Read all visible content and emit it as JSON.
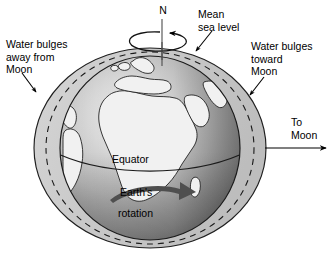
{
  "figure": {
    "kind": "earth-tidal-bulge-diagram",
    "background_color": "#ffffff",
    "ink_color": "#000000"
  },
  "labels": {
    "north_pole": "N",
    "mean_sea_level": "Mean\nsea level",
    "bulge_away": "Water bulges\naway from\nMoon",
    "bulge_toward": "Water bulges\ntoward\nMoon",
    "to_moon": "To\nMoon",
    "equator": "Equator",
    "earth_rotation_line1": "Earth's",
    "earth_rotation_line2": "rotation"
  },
  "colors": {
    "bulge_fill": "#c9c9c9",
    "sphere_light": "#f2f2f2",
    "sphere_mid": "#b5b5b5",
    "sphere_dark": "#8a8a8a",
    "sphere_darkest": "#6e6e6e",
    "land_fill": "#f0f0f0",
    "outline": "#1a1a1a",
    "dashed": "#1a1a1a",
    "rotation_arrow": "#4a4a4a"
  },
  "geometry": {
    "sphere_center_x": 150,
    "sphere_center_y": 148,
    "sphere_radius_x": 90,
    "sphere_radius_y": 92,
    "bulge_radius_x": 116,
    "bulge_radius_y": 100,
    "mean_sea_level_radius_x": 104,
    "mean_sea_level_radius_y": 96
  },
  "elements": {
    "polar_axis": "vertical rotation axis through north pole",
    "rotation_ellipse": "counterclockwise arrow circling the polar axis",
    "equator_line": "equator drawn across sphere",
    "to_moon_arrow": "horizontal arrow pointing right toward the Moon",
    "rotation_arrow": "thick curved arrow showing Earth's eastward rotation",
    "mean_sea_level_circle": "dashed circle marking undisturbed sea level",
    "bulge_outline": "solid ellipse elongated toward and away from the Moon"
  }
}
